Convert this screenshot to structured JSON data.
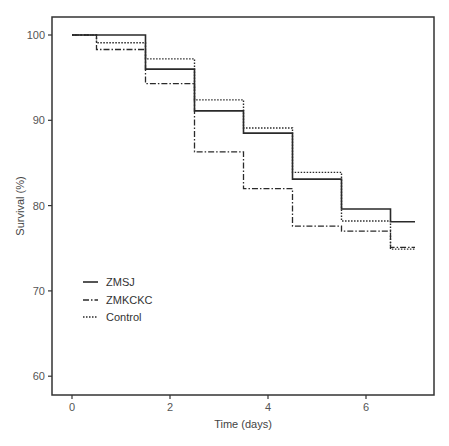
{
  "chart_data": {
    "type": "line",
    "subtype": "kaplan-meier step",
    "title": "",
    "xlabel": "Time (days)",
    "ylabel": "Survival (%)",
    "xlim": [
      -0.1,
      7.4
    ],
    "ylim": [
      57.8,
      104.2
    ],
    "xticks": [
      0,
      2,
      4,
      6
    ],
    "yticks": [
      60,
      70,
      80,
      90,
      100
    ],
    "grid": false,
    "legend_position": "lower-left inside",
    "series": [
      {
        "name": "ZMSJ",
        "style": "solid",
        "x": [
          0,
          1.5,
          2.5,
          3.5,
          4.5,
          5.5,
          6.5,
          7.0
        ],
        "y": [
          100,
          96.0,
          91.1,
          88.5,
          83.1,
          79.6,
          78.1,
          78.1
        ]
      },
      {
        "name": "ZMKCKC",
        "style": "dashdot",
        "x": [
          0,
          0.5,
          1.5,
          2.5,
          3.5,
          4.5,
          5.5,
          6.5,
          7.0
        ],
        "y": [
          100,
          98.3,
          94.3,
          86.3,
          82.0,
          77.6,
          77.0,
          75.1,
          75.1
        ]
      },
      {
        "name": "Control",
        "style": "dotted",
        "x": [
          0,
          0.5,
          1.5,
          2.5,
          3.5,
          4.5,
          5.5,
          6.5,
          7.0
        ],
        "y": [
          100,
          99.1,
          97.2,
          92.4,
          89.1,
          83.9,
          78.2,
          74.9,
          74.9
        ]
      }
    ]
  },
  "colors": {
    "line": "#2a2a2a",
    "axis": "#333333",
    "text": "#555555"
  }
}
